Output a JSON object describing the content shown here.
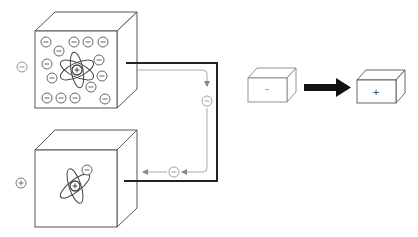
{
  "diagram": {
    "type": "charge-transfer illustration",
    "colors": {
      "stroke": "#555555",
      "wire": "#222222",
      "flow": "#999999",
      "arrow": "#111111",
      "charge_circle": "#666666"
    },
    "left_panel": {
      "top_block": {
        "side_label": "−",
        "center_symbol": "+",
        "electron_symbol": "−",
        "electron_count": 18,
        "description": "Negatively charged block with excess electrons around an atom"
      },
      "bottom_block": {
        "side_label": "+",
        "center_symbol": "+",
        "electron_symbol": "−",
        "electron_count": 1,
        "description": "Positively charged block with atom missing electrons"
      },
      "flow": {
        "electron_markers": [
          "−",
          "−"
        ],
        "direction": "from top block to bottom block"
      }
    },
    "right_panel": {
      "source_box": {
        "label": "–"
      },
      "target_box": {
        "label": "+"
      },
      "arrow": "right"
    }
  }
}
